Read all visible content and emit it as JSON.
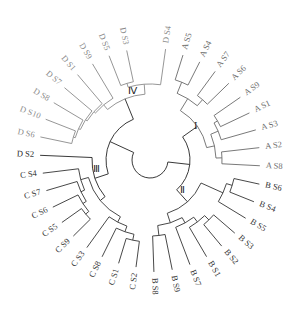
{
  "figure": {
    "type": "circular-dendrogram",
    "colors": {
      "A": "#6a6a6a",
      "B": "#333333",
      "C": "#333333",
      "D": "#8a8a8a",
      "D_S2": "#222222",
      "root": "#222222"
    },
    "clusters": [
      {
        "id": "I",
        "label": "I",
        "group": "A"
      },
      {
        "id": "II",
        "label": "Ⅱ",
        "group": "B"
      },
      {
        "id": "III",
        "label": "Ⅲ",
        "group": "C"
      },
      {
        "id": "IV",
        "label": "Ⅳ",
        "group": "D"
      }
    ],
    "leaves": [
      {
        "label": "D S4",
        "group": "D"
      },
      {
        "label": "A S5",
        "group": "A"
      },
      {
        "label": "A S4",
        "group": "A"
      },
      {
        "label": "A S7",
        "group": "A"
      },
      {
        "label": "A S6",
        "group": "A"
      },
      {
        "label": "A S9",
        "group": "A"
      },
      {
        "label": "A S1",
        "group": "A"
      },
      {
        "label": "A S3",
        "group": "A"
      },
      {
        "label": "A S2",
        "group": "A"
      },
      {
        "label": "A S8",
        "group": "A"
      },
      {
        "label": "B S6",
        "group": "B"
      },
      {
        "label": "B S4",
        "group": "B"
      },
      {
        "label": "B S5",
        "group": "B"
      },
      {
        "label": "B S3",
        "group": "B"
      },
      {
        "label": "B S2",
        "group": "B"
      },
      {
        "label": "B S1",
        "group": "B"
      },
      {
        "label": "B S7",
        "group": "B"
      },
      {
        "label": "B S9",
        "group": "B"
      },
      {
        "label": "B S8",
        "group": "B"
      },
      {
        "label": "C S2",
        "group": "C"
      },
      {
        "label": "C S1",
        "group": "C"
      },
      {
        "label": "C S8",
        "group": "C"
      },
      {
        "label": "C S3",
        "group": "C"
      },
      {
        "label": "C S9",
        "group": "C"
      },
      {
        "label": "C S5",
        "group": "C"
      },
      {
        "label": "C S6",
        "group": "C"
      },
      {
        "label": "C S7",
        "group": "C"
      },
      {
        "label": "C S4",
        "group": "C"
      },
      {
        "label": "D S2",
        "group": "D2"
      },
      {
        "label": "D S6",
        "group": "D"
      },
      {
        "label": "D S10",
        "group": "D"
      },
      {
        "label": "D S8",
        "group": "D"
      },
      {
        "label": "D S7",
        "group": "D"
      },
      {
        "label": "D S1",
        "group": "D"
      },
      {
        "label": "D S9",
        "group": "D"
      },
      {
        "label": "D S5",
        "group": "D"
      },
      {
        "label": "D S3",
        "group": "D"
      }
    ]
  }
}
